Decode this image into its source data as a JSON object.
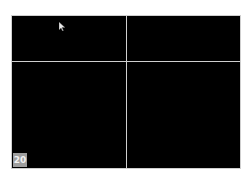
{
  "viewer": {
    "layout": "2x2",
    "panes": [
      {
        "id": "top-left"
      },
      {
        "id": "top-right"
      },
      {
        "id": "bottom-left"
      },
      {
        "id": "bottom-right"
      }
    ],
    "badge_number": "20",
    "colors": {
      "background": "#000000",
      "divider": "#cfcfcf",
      "badge": "#9e9e9e"
    }
  }
}
